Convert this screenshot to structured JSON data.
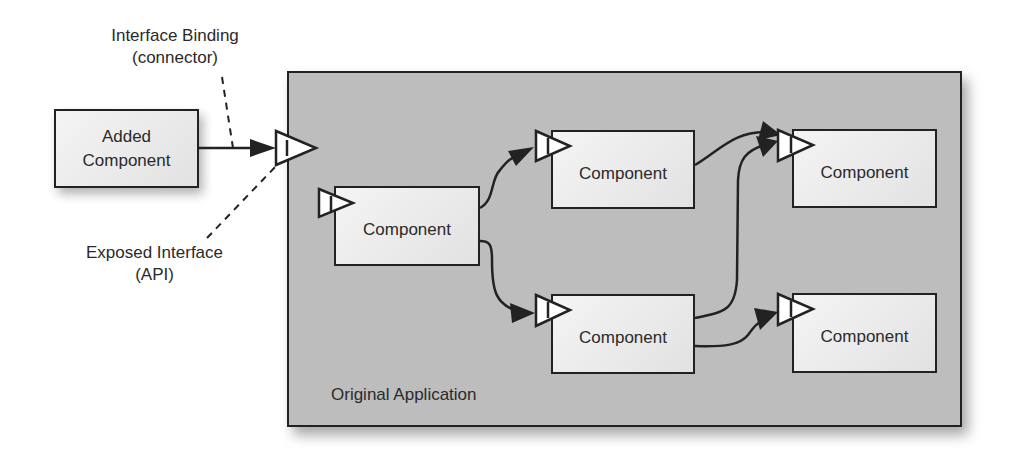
{
  "diagram": {
    "annotations": {
      "binding_line1": "Interface Binding",
      "binding_line2": "(connector)",
      "exposed_line1": "Exposed Interface",
      "exposed_line2": "(API)"
    },
    "added_component": {
      "line1": "Added",
      "line2": "Component"
    },
    "application": {
      "label": "Original Application"
    },
    "components": [
      {
        "id": "c1",
        "label": "Component"
      },
      {
        "id": "c2",
        "label": "Component"
      },
      {
        "id": "c3",
        "label": "Component"
      },
      {
        "id": "c4",
        "label": "Component"
      },
      {
        "id": "c5",
        "label": "Component"
      }
    ],
    "interface_symbol": "I",
    "colors": {
      "application_fill": "#bdbdbd",
      "component_fill": "#ececec",
      "stroke": "#222222",
      "background": "#ffffff"
    },
    "connections": [
      {
        "from": "added_component",
        "to": "exposed_interface"
      },
      {
        "from": "c1",
        "to": "c2"
      },
      {
        "from": "c1",
        "to": "c4"
      },
      {
        "from": "c2",
        "to": "c3"
      },
      {
        "from": "c4",
        "to": "c3"
      },
      {
        "from": "c4",
        "to": "c5"
      }
    ]
  }
}
